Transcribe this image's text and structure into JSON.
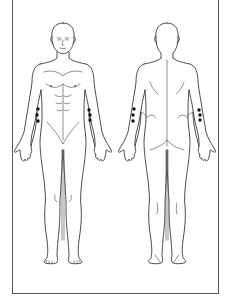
{
  "diagram": {
    "type": "body-chart",
    "views": [
      {
        "id": "front",
        "label": "anterior view",
        "markers": [
          {
            "region": "right-forearm",
            "points": [
              [
                38,
                109
              ],
              [
                37,
                115
              ],
              [
                38,
                121
              ]
            ]
          },
          {
            "region": "left-forearm",
            "points": [
              [
                89,
                110
              ],
              [
                90,
                115
              ],
              [
                90,
                120
              ]
            ]
          }
        ]
      },
      {
        "id": "back",
        "label": "posterior view",
        "markers": [
          {
            "region": "left-forearm",
            "points": [
              [
                134,
                109
              ],
              [
                133,
                115
              ],
              [
                133,
                121
              ]
            ]
          },
          {
            "region": "right-forearm",
            "points": [
              [
                199,
                110
              ],
              [
                200,
                115
              ],
              [
                200,
                120
              ]
            ]
          }
        ]
      }
    ],
    "colors": {
      "line": "#222222",
      "marker": "#111111",
      "frame": "#555555",
      "background": "#ffffff"
    }
  }
}
